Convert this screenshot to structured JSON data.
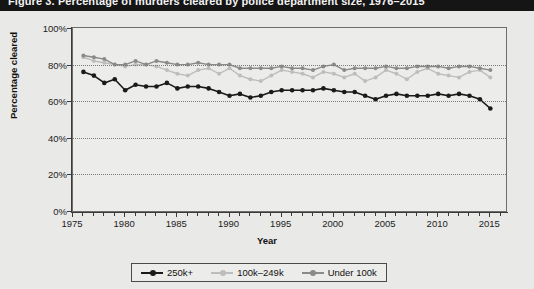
{
  "titlebar": {
    "text": "Figure 3. Percentage of murders cleared by police department size, 1976–2015"
  },
  "axes": {
    "ylabel": "Percentage cleared",
    "xlabel": "Year",
    "yticks": [
      "0%",
      "20%",
      "40%",
      "60%",
      "80%",
      "100%"
    ],
    "xticks": [
      "1975",
      "1980",
      "1985",
      "1990",
      "1995",
      "2000",
      "2005",
      "2010",
      "2015"
    ]
  },
  "legend": {
    "items": [
      {
        "label": "250k+",
        "color": "#1a1a1a"
      },
      {
        "label": "100k–249k",
        "color": "#bdbdbd"
      },
      {
        "label": "Under 100k",
        "color": "#8a8a8a"
      }
    ]
  },
  "chart_data": {
    "type": "line",
    "title": "Percentage of murders cleared by police department size, 1976–2015",
    "xlabel": "Year",
    "ylabel": "Percentage cleared",
    "xlim": [
      1975,
      2016.5
    ],
    "ylim": [
      0,
      100
    ],
    "grid": true,
    "legend_position": "bottom-center",
    "x": [
      1976,
      1977,
      1978,
      1979,
      1980,
      1981,
      1982,
      1983,
      1984,
      1985,
      1986,
      1987,
      1988,
      1989,
      1990,
      1991,
      1992,
      1993,
      1994,
      1995,
      1996,
      1997,
      1998,
      1999,
      2000,
      2001,
      2002,
      2003,
      2004,
      2005,
      2006,
      2007,
      2008,
      2009,
      2010,
      2011,
      2012,
      2013,
      2014,
      2015
    ],
    "series": [
      {
        "name": "250k+",
        "color": "#1a1a1a",
        "marker": "circle",
        "values": [
          76,
          74,
          70,
          72,
          66,
          69,
          68,
          68,
          70,
          67,
          68,
          68,
          67,
          65,
          63,
          64,
          62,
          63,
          65,
          66,
          66,
          66,
          66,
          67,
          66,
          65,
          65,
          63,
          61,
          63,
          64,
          63,
          63,
          63,
          64,
          63,
          64,
          63,
          61,
          56
        ]
      },
      {
        "name": "100k–249k",
        "color": "#bdbdbd",
        "marker": "circle",
        "values": [
          84,
          82,
          81,
          80,
          79,
          80,
          80,
          79,
          77,
          75,
          74,
          77,
          78,
          75,
          78,
          74,
          72,
          71,
          74,
          77,
          76,
          75,
          73,
          76,
          75,
          73,
          75,
          71,
          73,
          77,
          75,
          72,
          76,
          78,
          75,
          74,
          73,
          76,
          77,
          73
        ]
      },
      {
        "name": "Under 100k",
        "color": "#8a8a8a",
        "marker": "circle",
        "values": [
          85,
          84,
          83,
          80,
          80,
          82,
          80,
          82,
          81,
          80,
          80,
          81,
          80,
          80,
          80,
          78,
          78,
          78,
          78,
          79,
          78,
          78,
          77,
          79,
          80,
          77,
          78,
          78,
          78,
          79,
          78,
          78,
          79,
          79,
          79,
          78,
          79,
          79,
          78,
          77
        ]
      }
    ]
  }
}
